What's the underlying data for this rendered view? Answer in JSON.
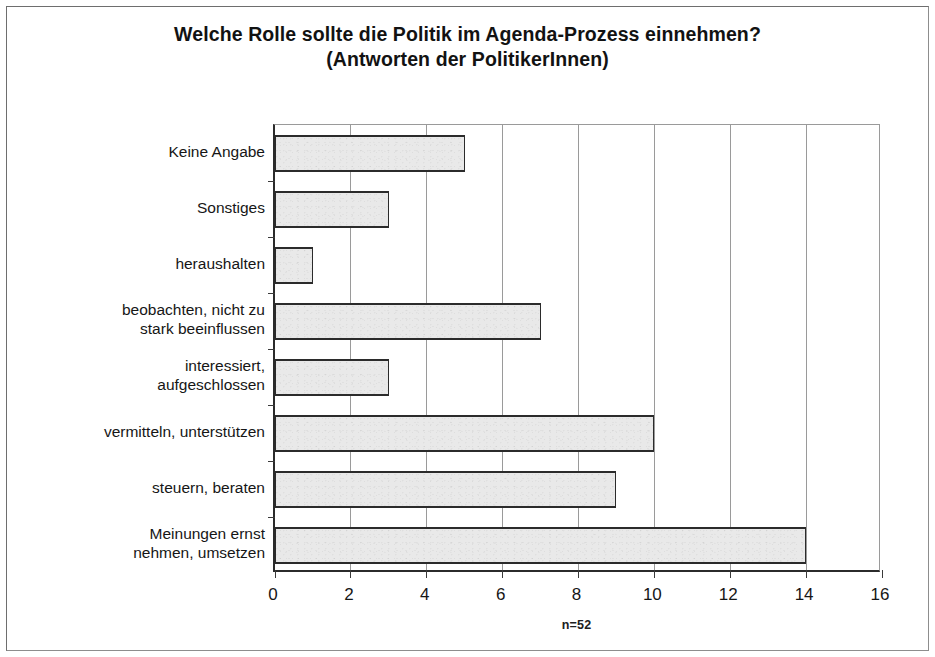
{
  "chart_data": {
    "type": "bar",
    "orientation": "horizontal",
    "title": "Welche Rolle sollte die Politik im Agenda-Prozess einnehmen?",
    "subtitle": "(Antworten der PolitikerInnen)",
    "annotation": "n=52",
    "xlabel": "",
    "ylabel": "",
    "xlim": [
      0,
      16
    ],
    "xticks": [
      0,
      2,
      4,
      6,
      8,
      10,
      12,
      14,
      16
    ],
    "grid": "vertical",
    "legend": "none",
    "categories": [
      "Keine Angabe",
      "Sonstiges",
      "heraushalten",
      "beobachten, nicht zu stark beeinflussen",
      "interessiert, aufgeschlossen",
      "vermitteln, unterstützen",
      "steuern, beraten",
      "Meinungen ernst nehmen, umsetzen"
    ],
    "category_lines": [
      [
        "Keine Angabe"
      ],
      [
        "Sonstiges"
      ],
      [
        "heraushalten"
      ],
      [
        "beobachten, nicht zu",
        "stark beeinflussen"
      ],
      [
        "interessiert,",
        "aufgeschlossen"
      ],
      [
        "vermitteln, unterstützen"
      ],
      [
        "steuern, beraten"
      ],
      [
        "Meinungen ernst",
        "nehmen, umsetzen"
      ]
    ],
    "values": [
      5,
      3,
      1,
      7,
      3,
      10,
      9,
      14
    ],
    "colors": {
      "bar_fill": "#e9e9e9",
      "bar_border": "#2b2b2b",
      "grid": "#9a9a9a",
      "axis": "#2b2b2b",
      "text": "#161616",
      "page_border": "#8d8d8d"
    }
  }
}
